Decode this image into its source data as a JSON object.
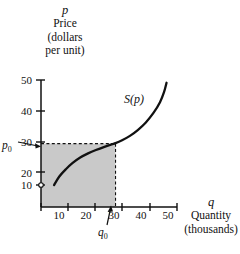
{
  "figure": {
    "kind": "supply-curve-diagram",
    "background": "#ffffff",
    "ink_color": "#111111",
    "shade_color": "#c9c9c9"
  },
  "axes": {
    "y": {
      "var": "p",
      "caption_lines": [
        "Price",
        "(dollars",
        "per unit)"
      ],
      "ticks": [
        10,
        20,
        30,
        40,
        50
      ],
      "tick_labels": [
        "10",
        "20",
        "30",
        "40",
        "50"
      ],
      "min": 0,
      "max": 55
    },
    "x": {
      "var": "q",
      "caption_lines": [
        "Quantity",
        "(thousands)"
      ],
      "ticks": [
        10,
        20,
        30,
        40,
        50
      ],
      "tick_labels": [
        "10",
        "20",
        "30",
        "40",
        "50"
      ],
      "min": 0,
      "max": 52
    }
  },
  "annotations": {
    "curve_label": "S(p)",
    "price_marker": "p",
    "price_marker_sub": "0",
    "quantity_marker": "q",
    "quantity_marker_sub": "0"
  },
  "chart_data": {
    "type": "line",
    "title": "",
    "xlabel": "q  Quantity (thousands)",
    "ylabel": "p  Price (dollars per unit)",
    "xlim": [
      0,
      52
    ],
    "ylim": [
      0,
      55
    ],
    "grid": false,
    "legend": "none",
    "series": [
      {
        "name": "S(p)",
        "label_position": {
          "q": 36,
          "p": 40
        },
        "points": [
          {
            "q": 5.0,
            "p": 9.0
          },
          {
            "q": 7.0,
            "p": 12.5
          },
          {
            "q": 9.5,
            "p": 15.5
          },
          {
            "q": 12.0,
            "p": 18.0
          },
          {
            "q": 15.0,
            "p": 20.3
          },
          {
            "q": 18.0,
            "p": 22.0
          },
          {
            "q": 21.0,
            "p": 23.4
          },
          {
            "q": 24.0,
            "p": 24.6
          },
          {
            "q": 27.0,
            "p": 25.7
          },
          {
            "q": 28.5,
            "p": 26.2
          },
          {
            "q": 31.0,
            "p": 27.4
          },
          {
            "q": 34.0,
            "p": 29.2
          },
          {
            "q": 37.0,
            "p": 31.6
          },
          {
            "q": 40.0,
            "p": 34.6
          },
          {
            "q": 43.0,
            "p": 38.6
          },
          {
            "q": 45.5,
            "p": 43.0
          },
          {
            "q": 47.0,
            "p": 47.0
          },
          {
            "q": 48.0,
            "p": 51.0
          }
        ]
      }
    ],
    "equilibrium_point": {
      "q": 28.5,
      "p": 26.0,
      "q_label": "q0",
      "p_label": "p0"
    },
    "shaded_region": {
      "description": "consumer-surplus rectangle from origin to (q0, p0)",
      "x_range": [
        0,
        28.5
      ],
      "y_range": [
        0,
        26.0
      ],
      "color": "#c9c9c9"
    },
    "dashed_guides": [
      {
        "from": {
          "q": 0,
          "p": 26.0
        },
        "to": {
          "q": 28.5,
          "p": 26.0
        }
      },
      {
        "from": {
          "q": 28.5,
          "p": 0
        },
        "to": {
          "q": 28.5,
          "p": 26.0
        }
      }
    ],
    "origin_marker": {
      "q": 0,
      "p": 10.0,
      "style": "small-open-circle"
    }
  }
}
